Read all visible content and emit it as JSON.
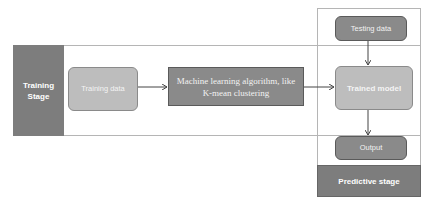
{
  "training_stage": {
    "label": "Training Stage",
    "nodes": {
      "training_data": "Training data",
      "ml_algorithm": "Machine learning algorithm, like K-mean clustering"
    }
  },
  "predictive_stage": {
    "label": "Predictive stage",
    "nodes": {
      "testing_data": "Testing data",
      "trained_model": "Trained model",
      "output": "Output"
    }
  },
  "edges": [
    {
      "from": "Training data",
      "to": "Machine learning algorithm, like K-mean clustering"
    },
    {
      "from": "Machine learning algorithm, like K-mean clustering",
      "to": "Trained model"
    },
    {
      "from": "Testing data",
      "to": "Trained model"
    },
    {
      "from": "Trained model",
      "to": "Output"
    }
  ],
  "colors": {
    "dark": "#7d7d7d",
    "mid": "#8a8a8a",
    "light": "#bdbdbd",
    "frame": "#b5b5b5"
  }
}
